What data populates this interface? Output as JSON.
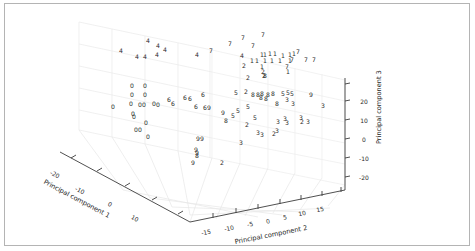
{
  "figure": {
    "background": "#ffffff",
    "frame_color": "#b4b4b4",
    "axis_color": "#3c3c3c",
    "grid_color": "#e8e8e8",
    "marker_color": "#2a2a2a"
  },
  "chart_data": {
    "type": "scatter",
    "projection": "3d",
    "title": "",
    "xlabel": "Principal component 1",
    "ylabel": "Principal component 2",
    "zlabel": "Principal component 3",
    "xticks": [
      "-20",
      "-10",
      "0",
      "10"
    ],
    "yticks": [
      "-15",
      "-10",
      "-5",
      "0",
      "5",
      "10",
      "15"
    ],
    "zticks": [
      "-20",
      "-10",
      "0",
      "10",
      "20"
    ],
    "xlim": [
      -25,
      15
    ],
    "ylim": [
      -17,
      17
    ],
    "zlim": [
      -25,
      25
    ],
    "grid": true,
    "legend": null,
    "marker_style": "digit-label",
    "note": "Each point is drawn as the text of its class digit (0-9).",
    "points": [
      {
        "label": "4",
        "px": 121,
        "py": 51
      },
      {
        "label": "4",
        "px": 148,
        "py": 41
      },
      {
        "label": "4",
        "px": 158,
        "py": 46
      },
      {
        "label": "4",
        "px": 165,
        "py": 50
      },
      {
        "label": "4",
        "px": 145,
        "py": 57
      },
      {
        "label": "4",
        "px": 157,
        "py": 55
      },
      {
        "label": "4",
        "px": 137,
        "py": 57
      },
      {
        "label": "4",
        "px": 197,
        "py": 55
      },
      {
        "label": "7",
        "px": 230,
        "py": 44
      },
      {
        "label": "7",
        "px": 243,
        "py": 38
      },
      {
        "label": "7",
        "px": 263,
        "py": 35
      },
      {
        "label": "7",
        "px": 253,
        "py": 46
      },
      {
        "label": "7",
        "px": 211,
        "py": 51
      },
      {
        "label": "7",
        "px": 298,
        "py": 52
      },
      {
        "label": "7",
        "px": 292,
        "py": 60
      },
      {
        "label": "7",
        "px": 306,
        "py": 60
      },
      {
        "label": "7",
        "px": 314,
        "py": 60
      },
      {
        "label": "7",
        "px": 287,
        "py": 67
      },
      {
        "label": "1",
        "px": 262,
        "py": 55
      },
      {
        "label": "1",
        "px": 265,
        "py": 55
      },
      {
        "label": "1",
        "px": 270,
        "py": 54
      },
      {
        "label": "1",
        "px": 275,
        "py": 54
      },
      {
        "label": "1",
        "px": 283,
        "py": 56
      },
      {
        "label": "1",
        "px": 290,
        "py": 55
      },
      {
        "label": "1",
        "px": 294,
        "py": 54
      },
      {
        "label": "1",
        "px": 252,
        "py": 61
      },
      {
        "label": "1",
        "px": 257,
        "py": 61
      },
      {
        "label": "1",
        "px": 265,
        "py": 61
      },
      {
        "label": "1",
        "px": 272,
        "py": 61
      },
      {
        "label": "1",
        "px": 280,
        "py": 61
      },
      {
        "label": "1",
        "px": 290,
        "py": 61
      },
      {
        "label": "1",
        "px": 262,
        "py": 67
      },
      {
        "label": "1",
        "px": 288,
        "py": 72
      },
      {
        "label": "4",
        "px": 242,
        "py": 56
      },
      {
        "label": "2",
        "px": 244,
        "py": 66
      },
      {
        "label": "2",
        "px": 263,
        "py": 72
      },
      {
        "label": "2",
        "px": 248,
        "py": 78
      },
      {
        "label": "2",
        "px": 264,
        "py": 76
      },
      {
        "label": "8",
        "px": 265,
        "py": 76
      },
      {
        "label": "0",
        "px": 132,
        "py": 86
      },
      {
        "label": "0",
        "px": 145,
        "py": 86
      },
      {
        "label": "0",
        "px": 132,
        "py": 95
      },
      {
        "label": "0",
        "px": 145,
        "py": 95
      },
      {
        "label": "0",
        "px": 113,
        "py": 107
      },
      {
        "label": "0",
        "px": 131,
        "py": 104
      },
      {
        "label": "0",
        "px": 140,
        "py": 105
      },
      {
        "label": "0",
        "px": 144,
        "py": 105
      },
      {
        "label": "0",
        "px": 154,
        "py": 104
      },
      {
        "label": "0",
        "px": 158,
        "py": 105
      },
      {
        "label": "0",
        "px": 133,
        "py": 114
      },
      {
        "label": "0",
        "px": 134,
        "py": 117
      },
      {
        "label": "0",
        "px": 136,
        "py": 130
      },
      {
        "label": "0",
        "px": 140,
        "py": 130
      },
      {
        "label": "0",
        "px": 148,
        "py": 137
      },
      {
        "label": "6",
        "px": 169,
        "py": 100
      },
      {
        "label": "6",
        "px": 185,
        "py": 98
      },
      {
        "label": "6",
        "px": 190,
        "py": 99
      },
      {
        "label": "6",
        "px": 173,
        "py": 104
      },
      {
        "label": "6",
        "px": 203,
        "py": 95
      },
      {
        "label": "6",
        "px": 196,
        "py": 107
      },
      {
        "label": "6",
        "px": 205,
        "py": 108
      },
      {
        "label": "5",
        "px": 236,
        "py": 93
      },
      {
        "label": "5",
        "px": 248,
        "py": 107
      },
      {
        "label": "9",
        "px": 209,
        "py": 108
      },
      {
        "label": "9",
        "px": 223,
        "py": 113
      },
      {
        "label": "5",
        "px": 238,
        "py": 111
      },
      {
        "label": "8",
        "px": 253,
        "py": 95
      },
      {
        "label": "8",
        "px": 258,
        "py": 95
      },
      {
        "label": "8",
        "px": 262,
        "py": 94
      },
      {
        "label": "8",
        "px": 268,
        "py": 95
      },
      {
        "label": "8",
        "px": 273,
        "py": 94
      },
      {
        "label": "8",
        "px": 261,
        "py": 98
      },
      {
        "label": "8",
        "px": 266,
        "py": 99
      },
      {
        "label": "5",
        "px": 283,
        "py": 94
      },
      {
        "label": "5",
        "px": 288,
        "py": 93
      },
      {
        "label": "5",
        "px": 292,
        "py": 94
      },
      {
        "label": "8",
        "px": 277,
        "py": 104
      },
      {
        "label": "3",
        "px": 287,
        "py": 100
      },
      {
        "label": "3",
        "px": 293,
        "py": 104
      },
      {
        "label": "9",
        "px": 311,
        "py": 95
      },
      {
        "label": "3",
        "px": 323,
        "py": 106
      },
      {
        "label": "8",
        "px": 226,
        "py": 121
      },
      {
        "label": "5",
        "px": 233,
        "py": 116
      },
      {
        "label": "2",
        "px": 247,
        "py": 125
      },
      {
        "label": "3",
        "px": 278,
        "py": 122
      },
      {
        "label": "3",
        "px": 285,
        "py": 119
      },
      {
        "label": "3",
        "px": 287,
        "py": 123
      },
      {
        "label": "3",
        "px": 301,
        "py": 118
      },
      {
        "label": "2",
        "px": 302,
        "py": 122
      },
      {
        "label": "3",
        "px": 308,
        "py": 122
      },
      {
        "label": "9",
        "px": 198,
        "py": 139
      },
      {
        "label": "9",
        "px": 202,
        "py": 139
      },
      {
        "label": "3",
        "px": 258,
        "py": 133
      },
      {
        "label": "3",
        "px": 262,
        "py": 135
      },
      {
        "label": "2",
        "px": 274,
        "py": 134
      },
      {
        "label": "3",
        "px": 277,
        "py": 131
      },
      {
        "label": "9",
        "px": 196,
        "py": 150
      },
      {
        "label": "9",
        "px": 197,
        "py": 153
      },
      {
        "label": "8",
        "px": 197,
        "py": 156
      },
      {
        "label": "3",
        "px": 241,
        "py": 143
      },
      {
        "label": "9",
        "px": 193,
        "py": 163
      },
      {
        "label": "2",
        "px": 222,
        "py": 163
      },
      {
        "label": "2",
        "px": 246,
        "py": 92
      },
      {
        "label": "5",
        "px": 255,
        "py": 118
      },
      {
        "label": "0",
        "px": 146,
        "py": 123
      }
    ]
  },
  "axes": {
    "x": {
      "label": "Principal component 1",
      "label_rotation_deg": 31,
      "ticks": [
        {
          "text": "-20",
          "px": 55,
          "py": 174
        },
        {
          "text": "-10",
          "px": 80,
          "py": 190
        },
        {
          "text": "0",
          "px": 110,
          "py": 204
        },
        {
          "text": "10",
          "px": 135,
          "py": 218
        }
      ]
    },
    "y": {
      "label": "Principal component 2",
      "label_rotation_deg": -12,
      "ticks": [
        {
          "text": "-15",
          "px": 206,
          "py": 232
        },
        {
          "text": "-10",
          "px": 229,
          "py": 228
        },
        {
          "text": "-5",
          "px": 250,
          "py": 224
        },
        {
          "text": "0",
          "px": 268,
          "py": 221
        },
        {
          "text": "5",
          "px": 285,
          "py": 217
        },
        {
          "text": "10",
          "px": 302,
          "py": 213
        },
        {
          "text": "15",
          "px": 320,
          "py": 209
        }
      ]
    },
    "z": {
      "label": "Principal component 3",
      "label_rotation_deg": -90,
      "ticks": [
        {
          "text": "20",
          "py": 101
        },
        {
          "text": "10",
          "py": 120
        },
        {
          "text": "0",
          "py": 139
        },
        {
          "text": "-10",
          "py": 158
        },
        {
          "text": "-20",
          "py": 177
        }
      ]
    }
  }
}
